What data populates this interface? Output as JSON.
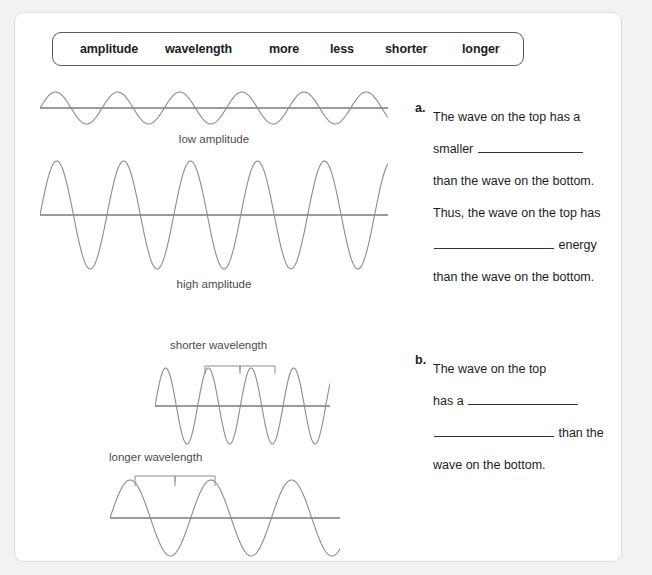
{
  "word_bank": {
    "items": [
      {
        "label": "amplitude",
        "x": 27
      },
      {
        "label": "wavelength",
        "x": 112
      },
      {
        "label": "more",
        "x": 216
      },
      {
        "label": "less",
        "x": 277
      },
      {
        "label": "shorter",
        "x": 332
      },
      {
        "label": "longer",
        "x": 409
      }
    ]
  },
  "figures": {
    "low_amplitude": {
      "caption": "low amplitude"
    },
    "high_amplitude": {
      "caption": "high amplitude"
    },
    "shorter_wavelength": {
      "label": "shorter wavelength"
    },
    "longer_wavelength": {
      "label": "longer wavelength"
    }
  },
  "questions": [
    {
      "marker": "a.",
      "lines": [
        {
          "before": "The wave on the top has a",
          "blank": false,
          "after": ""
        },
        {
          "before": "smaller ",
          "blank": true,
          "after": ""
        },
        {
          "before": "than the wave on the bottom.",
          "blank": false,
          "after": ""
        },
        {
          "before": "Thus, the wave on the top has",
          "blank": false,
          "after": ""
        },
        {
          "before": "",
          "blank": true,
          "after": " energy"
        },
        {
          "before": "than the wave on the bottom.",
          "blank": false,
          "after": ""
        }
      ]
    },
    {
      "marker": "b.",
      "lines": [
        {
          "before": "The wave on the top",
          "blank": false,
          "after": ""
        },
        {
          "before": "has a ",
          "blank": true,
          "after": ""
        },
        {
          "before": "",
          "blank": true,
          "after": " than the"
        },
        {
          "before": "wave on the bottom.",
          "blank": false,
          "after": ""
        }
      ]
    }
  ],
  "colors": {
    "wave_stroke": "#8c8c8c",
    "axis_stroke": "#7a7a7a",
    "text": "#1d1d1d",
    "caption": "#4c4c4c",
    "page_background": "#ffffff",
    "outer_background": "#f2f2f2"
  }
}
